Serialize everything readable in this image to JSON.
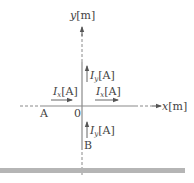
{
  "diagram": {
    "type": "coordinate-axes-with-currents",
    "axes": {
      "x": {
        "var": "x",
        "unit": "[m]"
      },
      "y": {
        "var": "y",
        "unit": "[m]"
      },
      "origin_label": "0"
    },
    "points": [
      {
        "label": "A",
        "location": "on negative x-axis"
      },
      {
        "label": "B",
        "location": "on negative y-axis"
      }
    ],
    "currents": [
      {
        "id": "ix_left",
        "symbol": "I",
        "subscript": "x",
        "unit": "[A]",
        "direction": "+x",
        "location": "negative x-axis, above"
      },
      {
        "id": "ix_right",
        "symbol": "I",
        "subscript": "x",
        "unit": "[A]",
        "direction": "+x",
        "location": "positive x-axis, above"
      },
      {
        "id": "iy_upper",
        "symbol": "I",
        "subscript": "y",
        "unit": "[A]",
        "direction": "+y",
        "location": "positive y-axis, right"
      },
      {
        "id": "iy_lower",
        "symbol": "I",
        "subscript": "y",
        "unit": "[A]",
        "direction": "+y",
        "location": "negative y-axis, right"
      }
    ],
    "colors": {
      "line": "#8a8a8a",
      "text": "#444444",
      "bar": "#b5b5b5"
    }
  }
}
